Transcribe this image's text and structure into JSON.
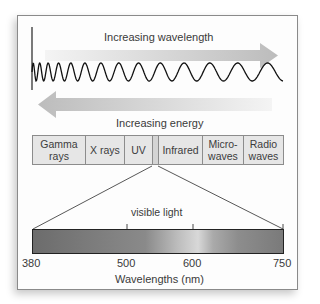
{
  "diagram": {
    "top_arrow": {
      "label": "Increasing wavelength",
      "direction": "right"
    },
    "bottom_arrow": {
      "label": "Increasing energy",
      "direction": "left"
    },
    "spectrum_regions": [
      {
        "label_line1": "Gamma",
        "label_line2": "rays"
      },
      {
        "label_line1": "X rays",
        "label_line2": ""
      },
      {
        "label_line1": "UV",
        "label_line2": ""
      },
      {
        "label_line1": "",
        "label_line2": ""
      },
      {
        "label_line1": "Infrared",
        "label_line2": ""
      },
      {
        "label_line1": "Micro-",
        "label_line2": "waves"
      },
      {
        "label_line1": "Radio",
        "label_line2": "waves"
      }
    ],
    "visible_label": "visible light",
    "scale": {
      "ticks": [
        "380",
        "500",
        "600",
        "750"
      ],
      "axis_label": "Wavelengths (nm)"
    },
    "colors": {
      "arrow": "#c8c8c8",
      "box_fill": "#e6e6e6",
      "frame": "#8a8a8a",
      "wave": "#111111"
    }
  }
}
